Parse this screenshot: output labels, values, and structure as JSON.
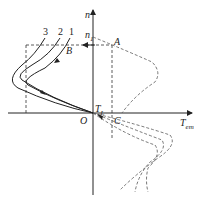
{
  "diagram": {
    "axes": {
      "y_label": "n",
      "x_label": "T",
      "x_label_sub": "em",
      "origin": "O"
    },
    "points": {
      "A": "A",
      "B": "B",
      "C": "C",
      "n1": "n",
      "n1_sub": "1",
      "TL": "T",
      "TL_sub": "L"
    },
    "curves": {
      "c1": "1",
      "c2": "2",
      "c3": "3"
    },
    "colors": {
      "solid": "#222222",
      "dashed": "#555555"
    }
  }
}
